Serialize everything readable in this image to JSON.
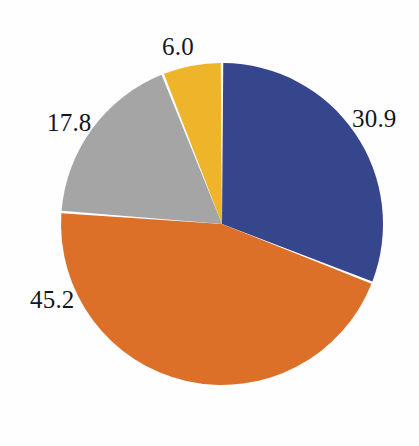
{
  "chart_data": {
    "type": "pie",
    "title": "",
    "subtitle": "",
    "xlabel": "",
    "ylabel": "",
    "legend": "none",
    "grid": false,
    "labels_position": "outside",
    "start_angle_deg": 0,
    "direction": "clockwise",
    "categories": [
      "Blue segment",
      "Orange segment",
      "Gray segment",
      "Yellow segment"
    ],
    "values": [
      30.9,
      45.2,
      17.8,
      6.0
    ],
    "value_labels": [
      "30.9",
      "45.2",
      "17.8",
      "6.0"
    ],
    "colors": [
      "#36468c",
      "#dd7029",
      "#a5a5a5",
      "#efb52a"
    ],
    "slice_gap_color": "#ffffff",
    "total": 99.9,
    "slices": [
      {
        "name": "blue-slice",
        "label": "30.9",
        "value": 30.9,
        "color": "#36468c"
      },
      {
        "name": "orange-slice",
        "label": "45.2",
        "value": 45.2,
        "color": "#dd7029"
      },
      {
        "name": "gray-slice",
        "label": "17.8",
        "value": 17.8,
        "color": "#a5a5a5"
      },
      {
        "name": "yellow-slice",
        "label": "6.0",
        "value": 6.0,
        "color": "#efb52a"
      }
    ]
  },
  "figure": {
    "background": "#fefefe",
    "label_color": "#14161c",
    "center_x": 222,
    "center_y": 224,
    "radius": 161
  }
}
